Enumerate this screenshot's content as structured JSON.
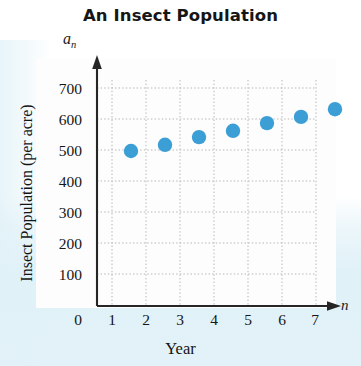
{
  "chart_data": {
    "type": "scatter",
    "title": "An Insect Population",
    "xlabel": "Year",
    "ylabel": "Insect Population (per acre)",
    "x_axis_symbol": "n",
    "y_axis_symbol": "a",
    "y_axis_symbol_subscript": "n",
    "x": [
      1,
      2,
      3,
      4,
      5,
      6,
      7
    ],
    "values": [
      500,
      520,
      545,
      565,
      590,
      610,
      635
    ],
    "points": [
      {
        "n": 1,
        "a": 500
      },
      {
        "n": 2,
        "a": 520
      },
      {
        "n": 3,
        "a": 545
      },
      {
        "n": 4,
        "a": 565
      },
      {
        "n": 5,
        "a": 590
      },
      {
        "n": 6,
        "a": 610
      },
      {
        "n": 7,
        "a": 635
      }
    ],
    "xlim": [
      0,
      7
    ],
    "ylim": [
      0,
      700
    ],
    "xticks": [
      "0",
      "1",
      "2",
      "3",
      "4",
      "5",
      "6",
      "7"
    ],
    "yticks": [
      "100",
      "200",
      "300",
      "400",
      "500",
      "600",
      "700"
    ],
    "grid": true,
    "grid_style": "dotted",
    "legend": null,
    "marker_color": "#3b9fd6",
    "axis_color": "#2a2a2a",
    "grid_color": "#b9b9b9"
  }
}
